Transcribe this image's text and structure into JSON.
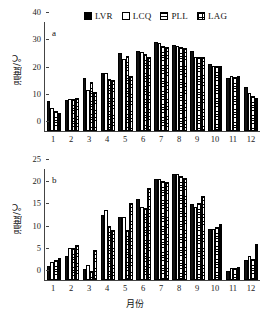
{
  "legend": {
    "items": [
      {
        "label": "LVR",
        "swatch": "solid-black-square-icon",
        "key": "LVR"
      },
      {
        "label": "LCQ",
        "swatch": "open-white-square-icon",
        "key": "LCQ"
      },
      {
        "label": "PLL",
        "swatch": "horizontal-striped-square-icon",
        "key": "PLL"
      },
      {
        "label": "LAG",
        "swatch": "cross-hatched-square-icon",
        "key": "LAG"
      }
    ]
  },
  "chart_data": [
    {
      "type": "bar",
      "panel": "a",
      "title": "",
      "xlabel": "",
      "ylabel": "温度/℃",
      "categories": [
        "1",
        "2",
        "3",
        "4",
        "5",
        "6",
        "7",
        "8",
        "9",
        "10",
        "11",
        "12"
      ],
      "ylim": [
        0,
        40
      ],
      "yticks": [
        0,
        10,
        20,
        30,
        40
      ],
      "grid": false,
      "legend_position": "top",
      "series": [
        {
          "name": "LVR",
          "values": [
            11.0,
            11.5,
            19.6,
            21.3,
            28.8,
            29.5,
            32.5,
            31.4,
            29.3,
            24.5,
            19.3,
            16.0
          ]
        },
        {
          "name": "LCQ",
          "values": [
            8.3,
            11.8,
            15.0,
            21.2,
            26.5,
            29.0,
            32.2,
            31.2,
            27.3,
            24.0,
            20.1,
            14.0
          ]
        },
        {
          "name": "PLL",
          "values": [
            7.2,
            11.8,
            18.1,
            19.1,
            27.5,
            28.2,
            31.3,
            31.0,
            27.2,
            23.8,
            20.0,
            13.0
          ]
        },
        {
          "name": "LAG",
          "values": [
            6.7,
            12.0,
            14.3,
            18.6,
            20.3,
            27.0,
            31.0,
            30.3,
            27.2,
            23.7,
            20.1,
            12.0
          ]
        }
      ]
    },
    {
      "type": "bar",
      "panel": "b",
      "title": "",
      "xlabel": "月份",
      "ylabel": "温度/℃",
      "categories": [
        "1",
        "2",
        "3",
        "4",
        "5",
        "6",
        "7",
        "8",
        "9",
        "10",
        "11",
        "12"
      ],
      "ylim": [
        0,
        25
      ],
      "yticks": [
        0,
        5,
        10,
        15,
        20,
        25
      ],
      "grid": false,
      "legend_position": "top",
      "series": [
        {
          "name": "LVR",
          "values": [
            3.1,
            5.4,
            2.4,
            14.6,
            14.2,
            18.3,
            22.8,
            23.8,
            17.2,
            11.4,
            2.1,
            4.6
          ]
        },
        {
          "name": "LCQ",
          "values": [
            4.0,
            7.2,
            3.3,
            15.7,
            14.1,
            16.4,
            22.8,
            23.8,
            16.4,
            11.5,
            2.8,
            5.3
          ]
        },
        {
          "name": "PLL",
          "values": [
            4.5,
            7.3,
            2.0,
            12.1,
            11.2,
            16.2,
            22.2,
            23.5,
            17.3,
            12.0,
            2.6,
            4.8
          ]
        },
        {
          "name": "LAG",
          "values": [
            4.9,
            7.9,
            6.8,
            11.2,
            17.3,
            20.8,
            22.1,
            23.0,
            18.9,
            12.6,
            2.9,
            8.1
          ]
        }
      ]
    }
  ],
  "panels": {
    "a": {
      "tag": "a"
    },
    "b": {
      "tag": "b"
    }
  }
}
